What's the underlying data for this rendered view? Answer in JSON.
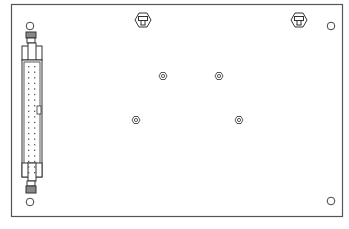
{
  "diagram": {
    "type": "pcb-mechanical-outline",
    "board": {
      "x": 11,
      "y": 4,
      "width": 332,
      "height": 213,
      "stroke": "#555555"
    },
    "mounting_holes": [
      {
        "id": "hole-top-left",
        "cx": 30,
        "cy": 26,
        "r": 4
      },
      {
        "id": "hole-top-right",
        "cx": 331,
        "cy": 26,
        "r": 4
      },
      {
        "id": "hole-bottom-left",
        "cx": 30,
        "cy": 201,
        "r": 4
      },
      {
        "id": "hole-bottom-right",
        "cx": 331,
        "cy": 201,
        "r": 4
      }
    ],
    "standoffs_top": [
      {
        "id": "standoff-left",
        "cx": 143,
        "cy": 20
      },
      {
        "id": "standoff-right",
        "cx": 299,
        "cy": 20
      }
    ],
    "hex_nuts": [
      {
        "id": "nut-1",
        "cx": 163,
        "cy": 76
      },
      {
        "id": "nut-2",
        "cx": 219,
        "cy": 76
      },
      {
        "id": "nut-3",
        "cx": 136,
        "cy": 120
      },
      {
        "id": "nut-4",
        "cx": 239,
        "cy": 120
      }
    ],
    "connector": {
      "id": "ribbon-header",
      "x": 22,
      "y": 33,
      "width": 20,
      "height": 161,
      "pin_rows": 20,
      "pin_cols": 2
    },
    "caption": ""
  }
}
